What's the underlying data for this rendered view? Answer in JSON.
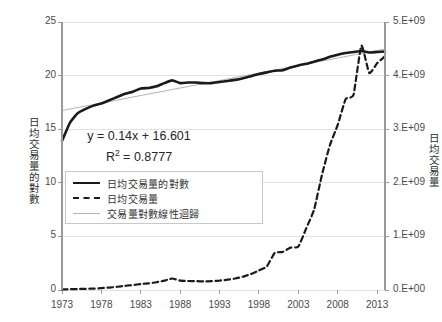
{
  "chart_data": {
    "type": "line",
    "title": "",
    "subtitle": "",
    "xlabel": "",
    "ylabel": "日均交易量的對數",
    "y2label": "日均交易量",
    "xlim": [
      1973,
      2014
    ],
    "ylim": [
      0,
      25
    ],
    "y2lim": [
      0,
      5000000000
    ],
    "grid": true,
    "grid_axis": "y",
    "legend_position": "lower-left",
    "x_ticks": [
      1973,
      1978,
      1983,
      1988,
      1993,
      1998,
      2003,
      2008,
      2013
    ],
    "x_tick_labels": [
      "1973",
      "1978",
      "1983",
      "1988",
      "1993",
      "1998",
      "2003",
      "2008",
      "2013"
    ],
    "y_ticks": [
      0,
      5,
      10,
      15,
      20,
      25
    ],
    "y_tick_labels": [
      "0",
      "5",
      "10",
      "15",
      "20",
      "25"
    ],
    "y2_ticks": [
      0,
      1000000000,
      2000000000,
      3000000000,
      4000000000,
      5000000000
    ],
    "y2_tick_labels": [
      "0.E+00",
      "1.E+09",
      "2.E+09",
      "3.E+09",
      "4.E+09",
      "5.E+09"
    ],
    "annotations": [
      {
        "text": "y = 0.14x + 16.601",
        "x": 1978,
        "y": 12.5
      },
      {
        "text": "R² = 0.8777",
        "x": 1978,
        "y": 11.2
      }
    ],
    "x": [
      1973,
      1974,
      1975,
      1976,
      1977,
      1978,
      1979,
      1980,
      1981,
      1982,
      1983,
      1984,
      1985,
      1986,
      1987,
      1988,
      1989,
      1990,
      1991,
      1992,
      1993,
      1994,
      1995,
      1996,
      1997,
      1998,
      1999,
      2000,
      2001,
      2002,
      2003,
      2004,
      2005,
      2006,
      2007,
      2008,
      2009,
      2010,
      2011,
      2012,
      2013,
      2014
    ],
    "series": [
      {
        "name": "日均交易量的對數",
        "axis": "left",
        "style": "solid",
        "color": "#1a1a1a",
        "width": 2.6,
        "values": [
          13.9,
          15.6,
          16.5,
          16.9,
          17.2,
          17.4,
          17.7,
          18.0,
          18.3,
          18.5,
          18.8,
          18.85,
          19.0,
          19.3,
          19.55,
          19.3,
          19.35,
          19.35,
          19.3,
          19.3,
          19.4,
          19.5,
          19.6,
          19.75,
          19.95,
          20.15,
          20.3,
          20.45,
          20.5,
          20.75,
          20.95,
          21.1,
          21.3,
          21.5,
          21.75,
          21.95,
          22.1,
          22.2,
          22.3,
          22.15,
          22.2,
          22.25
        ]
      },
      {
        "name": "日均交易量",
        "axis": "right",
        "style": "dashed",
        "color": "#1a1a1a",
        "width": 2.2,
        "values": [
          12000000,
          14000000,
          18000000,
          22000000,
          26000000,
          35000000,
          45000000,
          60000000,
          78000000,
          92000000,
          112000000,
          125000000,
          145000000,
          175000000,
          215000000,
          175000000,
          168000000,
          165000000,
          160000000,
          165000000,
          175000000,
          192000000,
          215000000,
          250000000,
          300000000,
          365000000,
          440000000,
          690000000,
          710000000,
          790000000,
          810000000,
          1150000000,
          1500000000,
          2150000000,
          2700000000,
          3080000000,
          3560000000,
          3640000000,
          4560000000,
          4050000000,
          4230000000,
          4360000000
        ]
      },
      {
        "name": "交易量對數線性迴歸",
        "axis": "left",
        "style": "solid",
        "color": "#b4b4b4",
        "width": 1,
        "equation": "y = 0.14x + 16.601",
        "r_squared": 0.8777,
        "values": [
          16.741,
          16.881,
          17.021,
          17.161,
          17.301,
          17.441,
          17.581,
          17.721,
          17.861,
          18.001,
          18.141,
          18.281,
          18.421,
          18.561,
          18.701,
          18.841,
          18.981,
          19.121,
          19.261,
          19.401,
          19.541,
          19.681,
          19.821,
          19.961,
          20.101,
          20.241,
          20.381,
          20.521,
          20.661,
          20.801,
          20.941,
          21.081,
          21.221,
          21.361,
          21.501,
          21.641,
          21.781,
          21.921,
          22.061,
          22.201,
          22.341,
          22.481
        ]
      }
    ]
  },
  "legend": {
    "entries": [
      {
        "label": "日均交易量的對數",
        "style": "solid"
      },
      {
        "label": "日均交易量",
        "style": "dashed"
      },
      {
        "label": "交易量對數線性迴歸",
        "style": "thin"
      }
    ]
  },
  "equation": {
    "line1": "y = 0.14x + 16.601",
    "r2_prefix": "R",
    "r2_sup": "2",
    "r2_value": " = 0.8777"
  },
  "colors": {
    "series_primary": "#1a1a1a",
    "series_regression": "#b4b4b4",
    "grid": "#e2e2e2",
    "axis": "#9a9a9a",
    "text": "#3a3a3a",
    "background": "#ffffff"
  }
}
